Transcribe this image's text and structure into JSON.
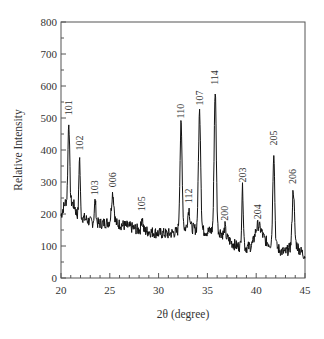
{
  "chart_data": {
    "type": "line",
    "title": "",
    "xlabel": "2θ (degree)",
    "ylabel": "Relative Intensity",
    "xlim": [
      20,
      45
    ],
    "ylim": [
      0,
      800
    ],
    "xticks": [
      20,
      25,
      30,
      35,
      40,
      45
    ],
    "yticks": [
      0,
      100,
      200,
      300,
      400,
      500,
      600,
      700,
      800
    ],
    "x_minor_step": 1,
    "y_minor_step": 50,
    "grid": false,
    "legend": "none",
    "baseline": [
      [
        20.0,
        195
      ],
      [
        20.3,
        225
      ],
      [
        20.5,
        240
      ],
      [
        21.0,
        238
      ],
      [
        21.4,
        225
      ],
      [
        21.6,
        200
      ],
      [
        22.5,
        185
      ],
      [
        23.0,
        175
      ],
      [
        24.0,
        170
      ],
      [
        25.0,
        175
      ],
      [
        26.0,
        168
      ],
      [
        27.0,
        160
      ],
      [
        28.0,
        150
      ],
      [
        29.0,
        145
      ],
      [
        30.0,
        140
      ],
      [
        31.0,
        138
      ],
      [
        32.0,
        145
      ],
      [
        33.0,
        160
      ],
      [
        34.0,
        150
      ],
      [
        35.0,
        145
      ],
      [
        36.0,
        150
      ],
      [
        36.5,
        140
      ],
      [
        37.5,
        110
      ],
      [
        38.0,
        100
      ],
      [
        39.0,
        95
      ],
      [
        39.5,
        100
      ],
      [
        40.0,
        130
      ],
      [
        40.5,
        140
      ],
      [
        41.0,
        115
      ],
      [
        41.5,
        105
      ],
      [
        42.0,
        100
      ],
      [
        42.5,
        85
      ],
      [
        43.0,
        80
      ],
      [
        43.5,
        95
      ],
      [
        44.0,
        110
      ],
      [
        44.5,
        85
      ],
      [
        45.0,
        70
      ]
    ],
    "peaks": [
      {
        "label": "101",
        "x": 20.8,
        "y": 490,
        "width": 0.12
      },
      {
        "label": "102",
        "x": 21.9,
        "y": 380,
        "width": 0.1
      },
      {
        "label": "103",
        "x": 23.5,
        "y": 240,
        "width": 0.12
      },
      {
        "label": "006",
        "x": 25.3,
        "y": 265,
        "width": 0.18
      },
      {
        "label": "105",
        "x": 28.3,
        "y": 190,
        "width": 0.12
      },
      {
        "label": "110",
        "x": 32.3,
        "y": 480,
        "width": 0.16
      },
      {
        "label": "112",
        "x": 33.1,
        "y": 215,
        "width": 0.15
      },
      {
        "label": "107",
        "x": 34.2,
        "y": 520,
        "width": 0.16
      },
      {
        "label": "114",
        "x": 35.8,
        "y": 585,
        "width": 0.15
      },
      {
        "label": "200",
        "x": 36.8,
        "y": 160,
        "width": 0.1
      },
      {
        "label": "203",
        "x": 38.6,
        "y": 280,
        "width": 0.12
      },
      {
        "label": "204",
        "x": 40.2,
        "y": 165,
        "width": 0.3
      },
      {
        "label": "205",
        "x": 41.8,
        "y": 395,
        "width": 0.14
      },
      {
        "label": "206",
        "x": 43.8,
        "y": 275,
        "width": 0.15
      }
    ],
    "noise_amplitude": 18,
    "line_color": "#111111"
  }
}
